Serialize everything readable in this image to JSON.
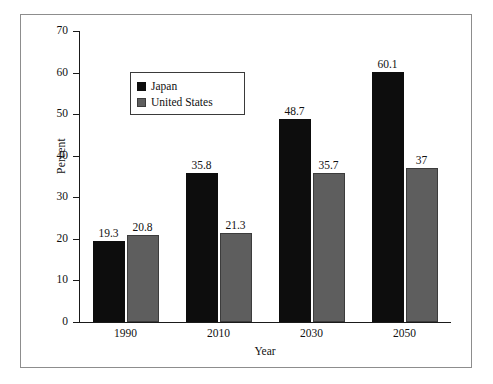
{
  "chart_data": {
    "type": "bar",
    "title": "",
    "subtitle": "",
    "xlabel": "Year",
    "ylabel": "Percent",
    "categories": [
      "1990",
      "2010",
      "2030",
      "2050"
    ],
    "series": [
      {
        "name": "Japan",
        "color": "#0d0d0d",
        "values": [
          19.3,
          35.8,
          48.7,
          60.1
        ]
      },
      {
        "name": "United States",
        "color": "#5e5e5e",
        "values": [
          20.8,
          21.3,
          35.7,
          37
        ]
      }
    ],
    "value_labels": [
      [
        "19.3",
        "20.8"
      ],
      [
        "35.8",
        "21.3"
      ],
      [
        "48.7",
        "35.7"
      ],
      [
        "60.1",
        "37"
      ]
    ],
    "ylim": [
      0,
      70
    ],
    "ytick_step": 10,
    "yticks": [
      "0",
      "10",
      "20",
      "30",
      "40",
      "50",
      "60",
      "70"
    ],
    "grid": false,
    "legend_position": "upper-left-inside"
  },
  "legend": {
    "entries": [
      {
        "label": "Japan",
        "swatch": "japan-swatch"
      },
      {
        "label": "United States",
        "swatch": "united-states-swatch"
      }
    ]
  },
  "axes": {
    "y_title": "Percent",
    "x_title": "Year"
  }
}
